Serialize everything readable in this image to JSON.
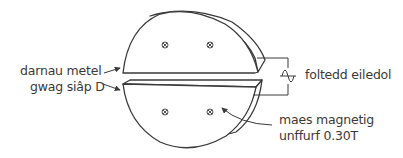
{
  "diagram": {
    "labels": {
      "metal_pieces": "darnau metel",
      "hollow_d": "gwag siâp D",
      "alternating_voltage": "foltedd eiledol",
      "field_line1": "maes magnetig",
      "field_line2": "unffurf 0.30T"
    },
    "icons": {
      "ac_source": "ac-voltage-source-icon",
      "field_into_page": "field-into-page-icon"
    },
    "field_symbol_count": 4,
    "colors": {
      "stroke": "#3a3a3a",
      "text": "#3a3a3a",
      "background": "#ffffff"
    }
  }
}
